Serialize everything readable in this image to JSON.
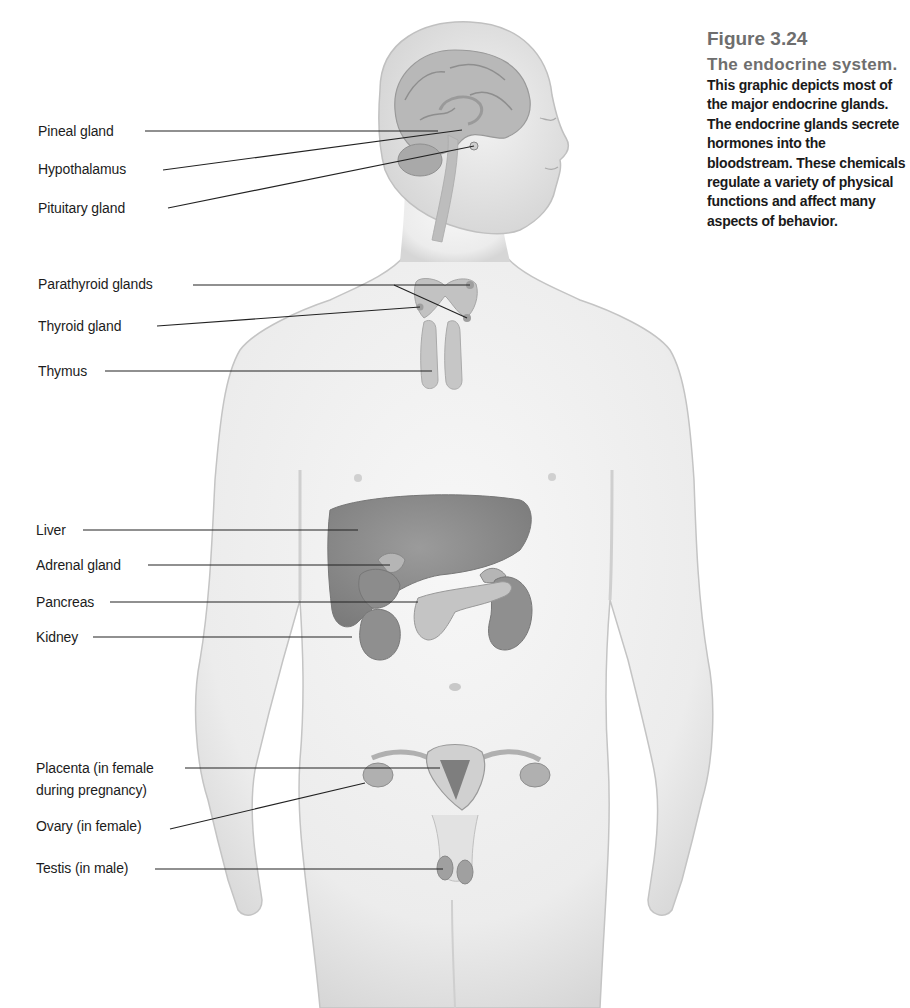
{
  "caption": {
    "figure_number": "Figure 3.24",
    "title": "The endocrine system.",
    "body": "This graphic depicts most of the major endocrine glands. The endocrine glands secrete hormones into the bloodstream. These chemicals regulate a variety of physical functions and affect many aspects of behavior."
  },
  "labels": [
    {
      "text": "Pineal gland"
    },
    {
      "text": "Hypothalamus"
    },
    {
      "text": "Pituitary gland"
    },
    {
      "text": "Parathyroid glands"
    },
    {
      "text": "Thyroid gland"
    },
    {
      "text": "Thymus"
    },
    {
      "text": "Liver"
    },
    {
      "text": "Adrenal gland"
    },
    {
      "text": "Pancreas"
    },
    {
      "text": "Kidney"
    },
    {
      "text": "Placenta (in female"
    },
    {
      "text": "during pregnancy)"
    },
    {
      "text": "Ovary (in female)"
    },
    {
      "text": "Testis (in male)"
    }
  ],
  "colors": {
    "skin_fill": "#eeeeee",
    "skin_outline": "#bdbdbd",
    "organ_dark": "#8a8a8a",
    "organ_mid": "#a8a8a8",
    "caption_heading": "#6e6e6e",
    "leader_line": "#222222"
  }
}
